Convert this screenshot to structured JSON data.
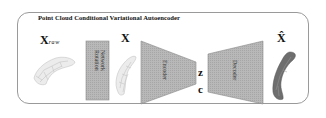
{
  "diagram": {
    "title": "Point Cloud Conditional Variational Autoencoder",
    "inputs": {
      "raw_label_main": "X",
      "raw_label_sub": "raw",
      "rotated_label": "X",
      "output_label": "X̂"
    },
    "blocks": {
      "rotation_network": "Rotation Network",
      "rotation_network_line1": "Rotation",
      "rotation_network_line2": "Network",
      "encoder": "Encoder",
      "decoder": "Decoder"
    },
    "latent": {
      "z_label": "z",
      "c_label": "c"
    },
    "colors": {
      "block_fill": "#b4b4b4",
      "block_stroke": "#7a7a7a",
      "frame_stroke": "#9a9a9a",
      "raw_cloud": "#bdbdbd",
      "reconstructed_cloud": "#6a6a6a"
    },
    "flow": [
      "X_raw",
      "Rotation Network",
      "X",
      "Encoder",
      "z, c",
      "Decoder",
      "X̂"
    ]
  }
}
